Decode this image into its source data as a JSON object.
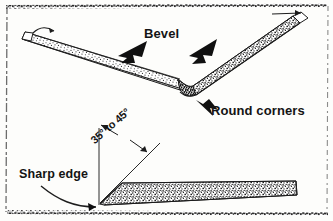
{
  "figure": {
    "background_color": "#fdfdfb",
    "ink_color": "#141414",
    "labels": {
      "bevel": "Bevel",
      "round_corners": "Round corners",
      "sharp_edge": "Sharp edge",
      "angle_range": "35° to 45°"
    },
    "callouts": [
      {
        "name": "bevel-arrow-left",
        "target": "left bevel face",
        "direction": "down-left"
      },
      {
        "name": "bevel-arrow-right",
        "target": "right bevel face",
        "direction": "down-left"
      },
      {
        "name": "round-corners-arrow",
        "target": "rounded corner of blade",
        "direction": "up-left"
      },
      {
        "name": "sharp-edge-arrow",
        "target": "blade cutting tip",
        "direction": "right"
      },
      {
        "name": "angle-arrow-upper",
        "target": "vertical reference line",
        "direction": "up-left"
      },
      {
        "name": "angle-arrow-lower",
        "target": "bevel slope line",
        "direction": "down-right"
      },
      {
        "name": "top-tip-arrow",
        "target": "upper blade tip",
        "direction": "right"
      },
      {
        "name": "left-tip-hook",
        "target": "left blade tip",
        "direction": "left"
      }
    ],
    "parts": [
      {
        "name": "v-blade-left-arm",
        "texture": "stipple"
      },
      {
        "name": "v-blade-right-arm",
        "texture": "stipple"
      },
      {
        "name": "v-blade-corner",
        "texture": "stipple",
        "note": "rounded junction"
      },
      {
        "name": "flat-blade",
        "texture": "stipple",
        "note": "side view wedge, tapered sharp edge at left"
      },
      {
        "name": "vertical-reference-line",
        "texture": "line"
      },
      {
        "name": "bevel-slope-line",
        "texture": "line"
      }
    ],
    "border": {
      "style": "rough scanned rule",
      "color": "#262626"
    }
  }
}
